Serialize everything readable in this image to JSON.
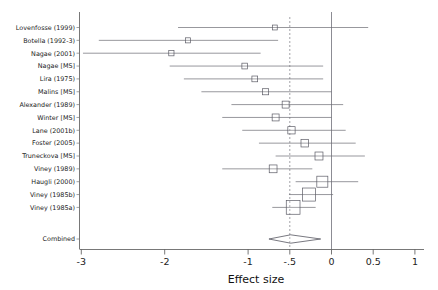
{
  "chart_data": {
    "type": "forest",
    "title": "",
    "xlabel": "Effect size",
    "ylabel": "",
    "xlim": [
      -3.25,
      1.15
    ],
    "xticks": [
      -3,
      -2,
      -1,
      -0.5,
      0,
      0.5,
      1
    ],
    "xtick_labels": [
      "-3",
      "-2",
      "-1",
      "-.5",
      "0",
      "0.5",
      "1"
    ],
    "grid": false,
    "legend": "none",
    "null_line": 0,
    "pooled_line": -0.49,
    "categories": [
      "Lovenfosse (1999)",
      "Botella (1992-3)",
      "Nagae (2001)",
      "Nagae [MS]",
      "Lira (1975)",
      "Malins [MS]",
      "Alexander (1989)",
      "Winter [MS]",
      "Lane (2001b)",
      "Foster (2005)",
      "Truneckova [MS]",
      "Viney (1989)",
      "Haugli (2000)",
      "Viney (1985b)",
      "Viney (1985a)",
      "Combined"
    ],
    "studies": [
      {
        "label": "Lovenfosse (1999)",
        "effect": -0.68,
        "ci_low": -1.84,
        "ci_high": 0.44,
        "weight": 0.1
      },
      {
        "label": "Botella (1992-3)",
        "effect": -1.72,
        "ci_low": -2.79,
        "ci_high": -0.64,
        "weight": 0.11
      },
      {
        "label": "Nagae (2001)",
        "effect": -1.92,
        "ci_low": -2.98,
        "ci_high": -0.85,
        "weight": 0.12
      },
      {
        "label": "Nagae [MS]",
        "effect": -1.04,
        "ci_low": -1.94,
        "ci_high": -0.1,
        "weight": 0.15
      },
      {
        "label": "Lira (1975)",
        "effect": -0.92,
        "ci_low": -1.77,
        "ci_high": -0.1,
        "weight": 0.15
      },
      {
        "label": "Malins [MS]",
        "effect": -0.79,
        "ci_low": -1.56,
        "ci_high": 0.0,
        "weight": 0.17
      },
      {
        "label": "Alexander (1989)",
        "effect": -0.55,
        "ci_low": -1.2,
        "ci_high": 0.14,
        "weight": 0.22
      },
      {
        "label": "Winter [MS]",
        "effect": -0.67,
        "ci_low": -1.31,
        "ci_high": 0.0,
        "weight": 0.22
      },
      {
        "label": "Lane (2001b)",
        "effect": -0.48,
        "ci_low": -1.07,
        "ci_high": 0.17,
        "weight": 0.24
      },
      {
        "label": "Foster (2005)",
        "effect": -0.32,
        "ci_low": -0.87,
        "ci_high": 0.29,
        "weight": 0.26
      },
      {
        "label": "Truneckova [MS]",
        "effect": -0.15,
        "ci_low": -0.67,
        "ci_high": 0.4,
        "weight": 0.28
      },
      {
        "label": "Viney (1989)",
        "effect": -0.7,
        "ci_low": -1.31,
        "ci_high": -0.23,
        "weight": 0.27
      },
      {
        "label": "Haugli (2000)",
        "effect": -0.11,
        "ci_low": -0.43,
        "ci_high": 0.32,
        "weight": 0.46
      },
      {
        "label": "Viney (1985b)",
        "effect": -0.27,
        "ci_low": -0.51,
        "ci_high": 0.02,
        "weight": 0.58
      },
      {
        "label": "Viney (1985a)",
        "effect": -0.46,
        "ci_low": -0.71,
        "ci_high": -0.19,
        "weight": 0.62
      }
    ],
    "combined": {
      "label": "Combined",
      "effect": -0.49,
      "ci_low": -0.75,
      "ci_high": -0.13
    }
  }
}
